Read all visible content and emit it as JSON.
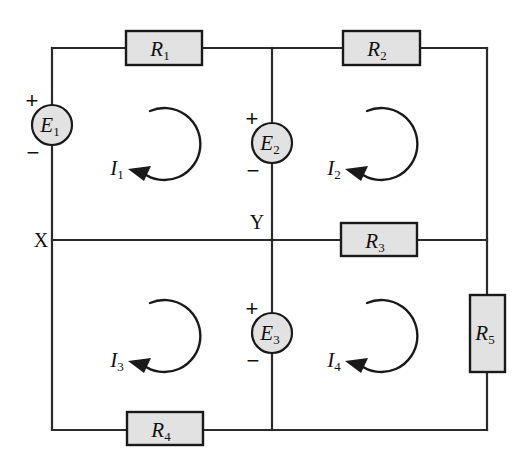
{
  "diagram": {
    "title": "Four-mesh DC resistor network with three voltage sources",
    "type": "circuit-schematic",
    "background_color": "#ffffff",
    "wire_color": "#2b2b2b",
    "component_fill": "#e2e2e2",
    "component_stroke": "#1a1a1a"
  },
  "resistors": [
    {
      "id": "R1",
      "label": "R",
      "subscript": "1",
      "orientation": "horizontal",
      "x": 126,
      "y": 31,
      "w": 76,
      "h": 34
    },
    {
      "id": "R2",
      "label": "R",
      "subscript": "2",
      "orientation": "horizontal",
      "x": 343,
      "y": 31,
      "w": 77,
      "h": 34
    },
    {
      "id": "R3",
      "label": "R",
      "subscript": "3",
      "orientation": "horizontal",
      "x": 341,
      "y": 223,
      "w": 76,
      "h": 33
    },
    {
      "id": "R4",
      "label": "R",
      "subscript": "4",
      "orientation": "horizontal",
      "x": 127,
      "y": 412,
      "w": 76,
      "h": 33
    },
    {
      "id": "R5",
      "label": "R",
      "subscript": "5",
      "orientation": "vertical",
      "x": 470,
      "y": 295,
      "w": 35,
      "h": 77
    }
  ],
  "sources": [
    {
      "id": "E1",
      "label": "E",
      "subscript": "1",
      "cx": 52,
      "cy": 125,
      "r": 20,
      "plus": "+",
      "minus": "−",
      "plus_x": 32,
      "plus_y": 100,
      "minus_x": 33,
      "minus_y": 152
    },
    {
      "id": "E2",
      "label": "E",
      "subscript": "2",
      "cx": 272,
      "cy": 143,
      "r": 20,
      "plus": "+",
      "minus": "−",
      "plus_x": 252,
      "plus_y": 118,
      "minus_x": 253,
      "minus_y": 170
    },
    {
      "id": "E3",
      "label": "E",
      "subscript": "3",
      "cx": 272,
      "cy": 333,
      "r": 20,
      "plus": "+",
      "minus": "−",
      "plus_x": 252,
      "plus_y": 308,
      "minus_x": 253,
      "minus_y": 360
    }
  ],
  "mesh_currents": [
    {
      "id": "I1",
      "label": "I",
      "subscript": "1",
      "direction": "counterclockwise",
      "cx": 165,
      "cy": 145,
      "r": 36,
      "text_x": 117,
      "text_y": 168
    },
    {
      "id": "I2",
      "label": "I",
      "subscript": "2",
      "direction": "counterclockwise",
      "cx": 382,
      "cy": 145,
      "r": 36,
      "text_x": 334,
      "text_y": 168
    },
    {
      "id": "I3",
      "label": "I",
      "subscript": "3",
      "direction": "counterclockwise",
      "cx": 165,
      "cy": 337,
      "r": 36,
      "text_x": 117,
      "text_y": 360
    },
    {
      "id": "I4",
      "label": "I",
      "subscript": "4",
      "direction": "counterclockwise",
      "cx": 382,
      "cy": 337,
      "r": 36,
      "text_x": 334,
      "text_y": 360
    }
  ],
  "nodes": [
    {
      "id": "X",
      "label": "X",
      "x": 41,
      "y": 240
    },
    {
      "id": "Y",
      "label": "Y",
      "x": 257,
      "y": 222
    }
  ],
  "wires": {
    "outer_rect": {
      "left": 52,
      "top": 48,
      "right": 487,
      "bottom": 430
    },
    "middle_horizontal_y": 240,
    "middle_vertical_x": 272
  }
}
